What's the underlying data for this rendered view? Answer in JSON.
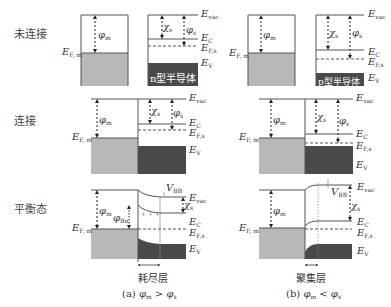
{
  "row_labels": {
    "unconnected": "未连接",
    "connected": "连接",
    "equilibrium": "平衡态"
  },
  "energy_labels": {
    "E": "E",
    "vac": "vac",
    "C": "C",
    "V": "V",
    "Fs": "F,s",
    "Fm": "F, m",
    "phi": "φ",
    "m": "m",
    "s": "s",
    "chi": "χ",
    "Bn": "Bn",
    "V_BB": "V",
    "BB": "BB"
  },
  "box_labels": {
    "n_type": "n型半导体",
    "p_type": "p型半导体"
  },
  "captions": {
    "depletion": "耗尽层",
    "accumulation": "聚集层",
    "a_prefix": "(a) ",
    "a_rel": " > ",
    "b_prefix": "(b) ",
    "b_rel": " < "
  },
  "colors": {
    "metal_fill": "#b8b8b8",
    "semi_fill": "#4a4a4a",
    "line": "#555555"
  }
}
